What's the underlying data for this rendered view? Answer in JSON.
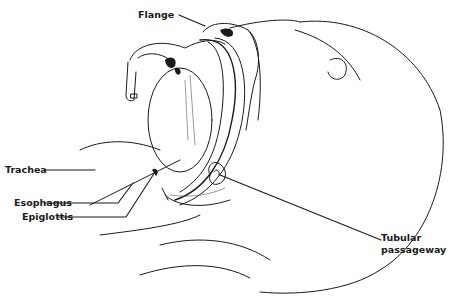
{
  "diagram": {
    "labels": {
      "flange": "Flange",
      "trachea": "Trachea",
      "esophagus": "Esophagus",
      "epiglottis": "Epiglottis",
      "tubular_line1": "Tubular",
      "tubular_line2": "passageway"
    },
    "colors": {
      "line": "#1a1a1a",
      "background": "#ffffff",
      "shade": "#555555"
    }
  }
}
